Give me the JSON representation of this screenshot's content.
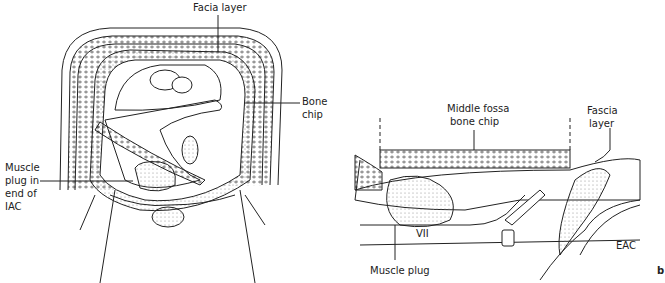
{
  "figure_a": {
    "labels": {
      "facia_layer": "Facia layer",
      "bone_chip_1": "Bone",
      "bone_chip_2": "chip",
      "muscle_1": "Muscle",
      "muscle_2": "plug in",
      "muscle_3": "end of",
      "muscle_4": "IAC"
    }
  },
  "figure_b": {
    "labels": {
      "middle_fossa_1": "Middle fossa",
      "middle_fossa_2": "bone chip",
      "fascia_1": "Fascia",
      "fascia_2": "layer",
      "vii": "VII",
      "eac": "EAC",
      "muscle_plug": "Muscle plug"
    },
    "panel_letter": "b"
  },
  "colors": {
    "line": "#222222",
    "stipple": "#555555"
  }
}
